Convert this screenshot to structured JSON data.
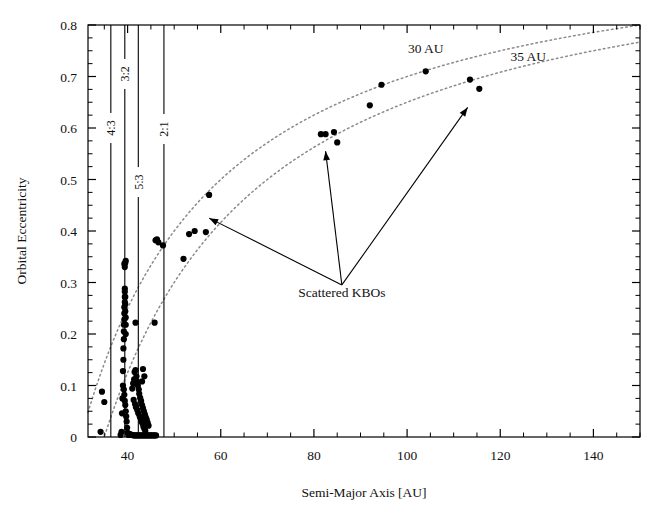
{
  "chart_data": {
    "type": "scatter",
    "title": "",
    "xlabel": "Semi-Major Axis [AU]",
    "ylabel": "Orbital Eccentricity",
    "xlim": [
      31.5,
      150
    ],
    "ylim": [
      0,
      0.8
    ],
    "grid": false,
    "legend": null,
    "xticks": [
      40,
      60,
      80,
      100,
      120,
      140
    ],
    "xtick_labels": [
      "40",
      "60",
      "80",
      "100",
      "120",
      "140"
    ],
    "yticks": [
      0,
      0.1,
      0.2,
      0.3,
      0.4,
      0.5,
      0.6,
      0.7,
      0.8
    ],
    "ytick_labels": [
      "0",
      "0.1",
      "0.2",
      "0.3",
      "0.4",
      "0.5",
      "0.6",
      "0.7",
      "0.8"
    ],
    "x_minor_tick_step": 5,
    "y_minor_tick_step": 0.025,
    "marker": "filled-circle",
    "marker_color": "#000000",
    "series": [
      {
        "name": "Kuiper Belt Objects",
        "points": [
          [
            34.2,
            0.01
          ],
          [
            34.5,
            0.088
          ],
          [
            35.0,
            0.068
          ],
          [
            38.5,
            0.004
          ],
          [
            38.7,
            0.01
          ],
          [
            38.8,
            0.046
          ],
          [
            38.9,
            0.075
          ],
          [
            39.0,
            0.1
          ],
          [
            39.0,
            0.128
          ],
          [
            39.1,
            0.15
          ],
          [
            39.1,
            0.172
          ],
          [
            39.2,
            0.19
          ],
          [
            39.2,
            0.205
          ],
          [
            39.2,
            0.218
          ],
          [
            39.3,
            0.228
          ],
          [
            39.3,
            0.24
          ],
          [
            39.3,
            0.252
          ],
          [
            39.4,
            0.262
          ],
          [
            39.4,
            0.272
          ],
          [
            39.4,
            0.282
          ],
          [
            39.4,
            0.288
          ],
          [
            39.5,
            0.272
          ],
          [
            39.5,
            0.258
          ],
          [
            39.5,
            0.244
          ],
          [
            39.6,
            0.232
          ],
          [
            39.6,
            0.218
          ],
          [
            39.6,
            0.2
          ],
          [
            39.4,
            0.33
          ],
          [
            39.5,
            0.338
          ],
          [
            39.6,
            0.342
          ],
          [
            39.3,
            0.336
          ],
          [
            39.2,
            0.092
          ],
          [
            39.3,
            0.082
          ],
          [
            39.4,
            0.07
          ],
          [
            39.5,
            0.062
          ],
          [
            39.6,
            0.05
          ],
          [
            39.7,
            0.04
          ],
          [
            39.8,
            0.03
          ],
          [
            39.9,
            0.018
          ],
          [
            40.0,
            0.008
          ],
          [
            40.2,
            0.004
          ],
          [
            40.4,
            0.006
          ],
          [
            41.0,
            0.094
          ],
          [
            41.2,
            0.104
          ],
          [
            41.4,
            0.112
          ],
          [
            41.5,
            0.126
          ],
          [
            41.7,
            0.13
          ],
          [
            41.9,
            0.118
          ],
          [
            42.0,
            0.108
          ],
          [
            42.2,
            0.1
          ],
          [
            42.4,
            0.092
          ],
          [
            42.5,
            0.084
          ],
          [
            42.7,
            0.076
          ],
          [
            42.9,
            0.07
          ],
          [
            43.1,
            0.062
          ],
          [
            43.3,
            0.056
          ],
          [
            43.5,
            0.05
          ],
          [
            43.7,
            0.044
          ],
          [
            43.9,
            0.038
          ],
          [
            44.1,
            0.034
          ],
          [
            44.3,
            0.028
          ],
          [
            44.5,
            0.022
          ],
          [
            41.3,
            0.072
          ],
          [
            41.6,
            0.064
          ],
          [
            41.8,
            0.058
          ],
          [
            42.1,
            0.052
          ],
          [
            42.3,
            0.046
          ],
          [
            42.6,
            0.04
          ],
          [
            42.8,
            0.036
          ],
          [
            43.0,
            0.03
          ],
          [
            43.2,
            0.026
          ],
          [
            43.4,
            0.02
          ],
          [
            43.6,
            0.016
          ],
          [
            43.8,
            0.012
          ],
          [
            40.8,
            0.004
          ],
          [
            41.0,
            0.004
          ],
          [
            41.3,
            0.003
          ],
          [
            41.6,
            0.003
          ],
          [
            41.9,
            0.003
          ],
          [
            42.2,
            0.003
          ],
          [
            42.5,
            0.003
          ],
          [
            42.8,
            0.003
          ],
          [
            43.1,
            0.003
          ],
          [
            43.4,
            0.003
          ],
          [
            43.7,
            0.003
          ],
          [
            44.0,
            0.003
          ],
          [
            44.3,
            0.003
          ],
          [
            44.6,
            0.003
          ],
          [
            44.9,
            0.003
          ],
          [
            45.2,
            0.003
          ],
          [
            45.5,
            0.003
          ],
          [
            45.8,
            0.003
          ],
          [
            46.1,
            0.003
          ],
          [
            41.7,
            0.222
          ],
          [
            43.1,
            0.108
          ],
          [
            43.3,
            0.132
          ],
          [
            43.6,
            0.118
          ],
          [
            45.8,
            0.222
          ],
          [
            46.0,
            0.382
          ],
          [
            46.3,
            0.384
          ],
          [
            46.6,
            0.378
          ],
          [
            47.6,
            0.372
          ],
          [
            52.0,
            0.346
          ],
          [
            53.2,
            0.394
          ],
          [
            54.4,
            0.4
          ],
          [
            56.8,
            0.398
          ],
          [
            57.5,
            0.47
          ],
          [
            81.5,
            0.588
          ],
          [
            82.5,
            0.588
          ],
          [
            84.3,
            0.592
          ],
          [
            85.0,
            0.572
          ],
          [
            92.0,
            0.644
          ],
          [
            94.5,
            0.684
          ],
          [
            104.0,
            0.71
          ],
          [
            113.5,
            0.694
          ],
          [
            115.5,
            0.676
          ]
        ]
      }
    ],
    "curves": [
      {
        "name": "perihelion-30AU",
        "label": "30 AU",
        "style": "dotted",
        "color": "#8a8a8a",
        "equation": "q = a(1-e) = 30 AU",
        "q": 30
      },
      {
        "name": "perihelion-35AU",
        "label": "35 AU",
        "style": "dotted",
        "color": "#8a8a8a",
        "equation": "q = a(1-e) = 35 AU",
        "q": 35
      }
    ],
    "resonance_lines": [
      {
        "label": "4:3",
        "a": 36.4,
        "label_y": 0.6
      },
      {
        "label": "3:2",
        "a": 39.4,
        "label_y": 0.705
      },
      {
        "label": "5:3",
        "a": 42.3,
        "label_y": 0.495
      },
      {
        "label": "2:1",
        "a": 47.8,
        "label_y": 0.598
      }
    ],
    "annotations": [
      {
        "name": "scattered-kbos",
        "text": "Scattered KBOs",
        "x": 86,
        "y": 0.272,
        "arrows": [
          {
            "to_x": 57.5,
            "to_y": 0.425
          },
          {
            "to_x": 82.5,
            "to_y": 0.555
          },
          {
            "to_x": 113.0,
            "to_y": 0.64
          }
        ]
      },
      {
        "name": "curve-label-30au",
        "text": "30 AU",
        "x": 104,
        "y": 0.745
      },
      {
        "name": "curve-label-35au",
        "text": "35 AU",
        "x": 126,
        "y": 0.73
      }
    ]
  },
  "axes": {
    "x_title": "Semi-Major Axis [AU]",
    "y_title": "Orbital Eccentricity"
  }
}
